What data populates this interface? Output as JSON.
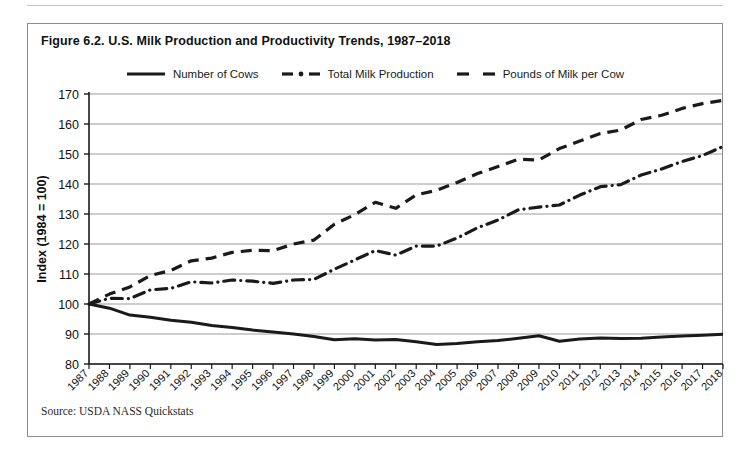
{
  "figure": {
    "title": "Figure 6.2. U.S. Milk Production and Productivity Trends, 1987–2018",
    "source": "Source: USDA NASS Quickstats"
  },
  "legend": {
    "items": [
      {
        "label": "Number of Cows",
        "style": "solid",
        "color": "#1a1a1a"
      },
      {
        "label": "Total Milk Production",
        "style": "dash-dot",
        "color": "#1a1a1a"
      },
      {
        "label": "Pounds of Milk per Cow",
        "style": "dashed",
        "color": "#1a1a1a"
      }
    ]
  },
  "axes": {
    "ylabel": "Index (1984 = 100)",
    "yticks": [
      "170",
      "160",
      "150",
      "140",
      "130",
      "120",
      "110",
      "100",
      "90",
      "80"
    ],
    "xlabel": ""
  },
  "chart_data": {
    "type": "line",
    "title": "Figure 6.2. U.S. Milk Production and Productivity Trends, 1987–2018",
    "xlabel": "",
    "ylabel": "Index (1984 = 100)",
    "ylim": [
      80,
      170
    ],
    "ytick_step": 10,
    "grid": "horizontal",
    "legend_position": "top-center",
    "categories": [
      "1987",
      "1988",
      "1989",
      "1990",
      "1991",
      "1992",
      "1993",
      "1994",
      "1995",
      "1996",
      "1997",
      "1998",
      "1999",
      "2000",
      "2001",
      "2002",
      "2003",
      "2004",
      "2005",
      "2006",
      "2007",
      "2008",
      "2009",
      "2010",
      "2011",
      "2012",
      "2013",
      "2014",
      "2015",
      "2016",
      "2017",
      "2018"
    ],
    "series": [
      {
        "name": "Number of Cows",
        "style": "solid",
        "color": "#1a1a1a",
        "values": [
          100.0,
          98.6,
          96.3,
          95.6,
          94.6,
          93.9,
          92.8,
          92.2,
          91.3,
          90.7,
          90.0,
          89.2,
          88.1,
          88.4,
          88.0,
          88.2,
          87.4,
          86.5,
          86.8,
          87.4,
          87.8,
          88.6,
          89.4,
          87.6,
          88.3,
          88.7,
          88.5,
          88.6,
          89.0,
          89.3,
          89.6,
          89.9
        ]
      },
      {
        "name": "Total Milk Production",
        "style": "dash-dot",
        "color": "#1a1a1a",
        "values": [
          100.0,
          101.9,
          101.8,
          104.7,
          105.2,
          107.4,
          107.0,
          108.0,
          107.6,
          106.9,
          108.0,
          108.2,
          111.6,
          114.7,
          117.8,
          116.3,
          119.3,
          119.3,
          122.0,
          125.4,
          128.0,
          131.4,
          132.3,
          133.0,
          136.3,
          139.1,
          139.8,
          143.0,
          145.0,
          147.5,
          149.5,
          152.5
        ]
      },
      {
        "name": "Pounds of Milk per Cow",
        "style": "dashed",
        "color": "#1a1a1a",
        "values": [
          100.0,
          103.3,
          105.7,
          109.5,
          111.2,
          114.4,
          115.3,
          117.2,
          117.9,
          117.8,
          120.0,
          121.3,
          126.6,
          129.8,
          133.9,
          131.9,
          136.4,
          137.9,
          140.5,
          143.5,
          145.8,
          148.3,
          148.0,
          151.8,
          154.3,
          156.8,
          158.0,
          161.5,
          162.9,
          165.2,
          166.8,
          167.9
        ]
      }
    ]
  }
}
